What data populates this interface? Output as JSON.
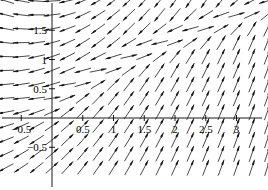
{
  "chart_data": {
    "type": "scatter",
    "plot_kind": "direction-field",
    "title": "",
    "xlabel": "",
    "ylabel": "",
    "xlim": [
      -0.85,
      3.55
    ],
    "ylim": [
      -0.95,
      1.92
    ],
    "grid": false,
    "legend": null,
    "axes": {
      "x_axis_y_value": 0,
      "y_axis_x_value": 0,
      "axis_color": "#000000",
      "arrow_color": "#1a1a1a"
    },
    "x_ticks": [
      {
        "value": -0.5,
        "label": "-0.5"
      },
      {
        "value": 0.5,
        "label": "0.5"
      },
      {
        "value": 1,
        "label": "1"
      },
      {
        "value": 1.5,
        "label": "1.5"
      },
      {
        "value": 2,
        "label": "2"
      },
      {
        "value": 2.5,
        "label": "2.5"
      },
      {
        "value": 3,
        "label": "3"
      }
    ],
    "y_ticks": [
      {
        "value": 1.5,
        "label": "1.5"
      },
      {
        "value": 1,
        "label": "1"
      },
      {
        "value": 0.5,
        "label": "0.5"
      },
      {
        "value": -0.5,
        "label": "-0.5"
      }
    ],
    "field_grid": {
      "x_start": -0.75,
      "x_step": 0.25,
      "x_count": 18,
      "y_start": -0.85,
      "y_step": 0.2375,
      "y_count": 13,
      "arrow_length_px": 17
    }
  }
}
